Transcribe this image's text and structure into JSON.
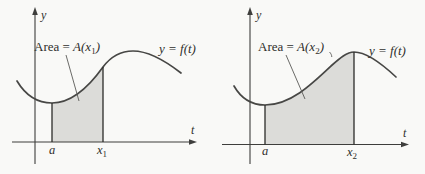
{
  "colors": {
    "background": "#f9f9f7",
    "region": "#dcdcd9",
    "curve": "#474745",
    "axis": "#3e3e3c",
    "vline": "#2b2b29",
    "leader": "#5a5a57",
    "text": "#2f2f2c"
  },
  "panels": [
    {
      "y_axis_label": "y",
      "t_axis_label": "t",
      "curve_label": "y = f(t)",
      "area_label": {
        "prefix": "Area = ",
        "func": "A(x",
        "sub": "1",
        "suffix": ")"
      },
      "lower_limit_label": "a",
      "upper_limit_label": {
        "base": "x",
        "sub": "1"
      }
    },
    {
      "y_axis_label": "y",
      "t_axis_label": "t",
      "curve_label": "y = f(t)",
      "area_label": {
        "prefix": "Area = ",
        "func": "A(x",
        "sub": "2",
        "suffix": ")"
      },
      "lower_limit_label": "a",
      "upper_limit_label": {
        "base": "x",
        "sub": "2"
      }
    }
  ]
}
